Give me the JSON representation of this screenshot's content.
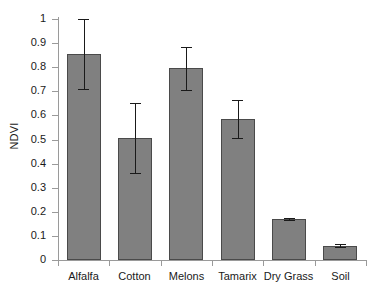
{
  "chart_data": {
    "type": "bar",
    "title": "",
    "xlabel": "",
    "ylabel": "NDVI",
    "ylim": [
      0,
      1
    ],
    "xlim_categories": 6,
    "grid": false,
    "legend": null,
    "categories": [
      "Alfalfa",
      "Cotton",
      "Melons",
      "Tamarix",
      "Dry Grass",
      "Soil"
    ],
    "values": [
      0.855,
      0.505,
      0.795,
      0.585,
      0.17,
      0.06
    ],
    "errors": [
      0.145,
      0.145,
      0.09,
      0.08,
      0.005,
      0.008
    ],
    "error_low": [
      0.71,
      0.36,
      0.705,
      0.505,
      0.165,
      0.052
    ],
    "error_high": [
      1.0,
      0.65,
      0.885,
      0.665,
      0.175,
      0.068
    ],
    "y_ticks": [
      0,
      0.1,
      0.2,
      0.3,
      0.4,
      0.5,
      0.6,
      0.7,
      0.8,
      0.9,
      1
    ],
    "y_tick_labels": [
      "0",
      "0.1",
      "0.2",
      "0.3",
      "0.4",
      "0.5",
      "0.6",
      "0.7",
      "0.8",
      "0.9",
      "1"
    ],
    "bar_color": "#808080",
    "bar_edge_color": "#4a4a4a",
    "error_color": "#1a1a1a",
    "axis_color": "#9a9a9a",
    "text_color": "#1a1a1a",
    "background": "#ffffff"
  }
}
